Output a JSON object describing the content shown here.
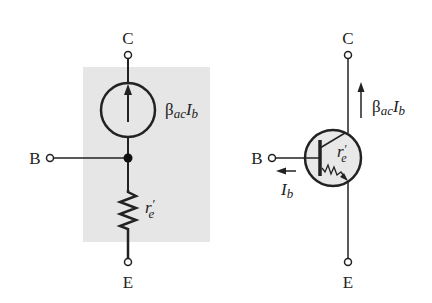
{
  "left": {
    "title": "ac equivalent (r-parameter) model",
    "labels": {
      "collector": "C",
      "base": "B",
      "emitter": "E"
    },
    "source_label": {
      "beta": "β",
      "sub": "ac",
      "i": "I",
      "isub": "b"
    },
    "resistor_label": {
      "r": "r",
      "prime": "′",
      "sub": "e"
    },
    "shade_color": "#e6e6e6"
  },
  "right": {
    "title": "Transistor symbol with internal r'e",
    "labels": {
      "collector": "C",
      "base": "B",
      "emitter": "E"
    },
    "collector_current": {
      "beta": "β",
      "sub": "ac",
      "i": "I",
      "isub": "b"
    },
    "base_current": {
      "i": "I",
      "sub": "b"
    },
    "resistor_label": {
      "r": "r",
      "prime": "′",
      "sub": "e"
    },
    "circle_fill": "#e8e8e8"
  }
}
